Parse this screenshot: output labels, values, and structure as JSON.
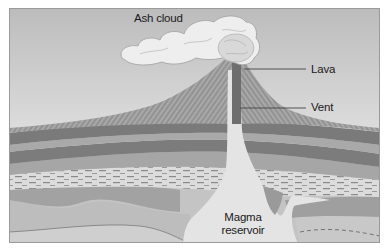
{
  "diagram": {
    "labels": {
      "ash_cloud": "Ash cloud",
      "lava": "Lava",
      "vent": "Vent",
      "magma_line1": "Magma",
      "magma_line2": "reservoir"
    },
    "colors": {
      "sky_top": "#b9b9b9",
      "sky_bottom": "#ebebeb",
      "cone": "#8f8f8f",
      "cone_stripe": "#a8a8a8",
      "vent": "#6f6f6f",
      "dark_layer": "#7a7a7a",
      "mid_layer": "#9c9c9c",
      "light_layer": "#d9d9d9",
      "magma": "#e6e6e6",
      "cloud": "#eeeeee",
      "leader_line": "#444444"
    }
  }
}
